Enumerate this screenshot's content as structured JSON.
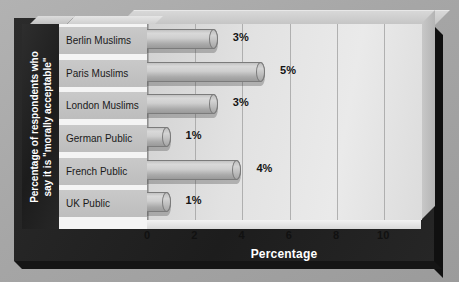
{
  "chart_data": {
    "type": "bar",
    "orientation": "horizontal",
    "title": "",
    "categories": [
      "Berlin Muslims",
      "Paris Muslims",
      "London Muslims",
      "German Public",
      "French Public",
      "UK Public"
    ],
    "values": [
      3,
      5,
      3,
      1,
      4,
      1
    ],
    "value_labels": [
      "3%",
      "5%",
      "3%",
      "1%",
      "4%",
      "1%"
    ],
    "xlabel": "Percentage",
    "ylabel": "Percentage of respondents who say it is \"morally acceptable\"",
    "ylabel_line1": "Percentage of respondents who",
    "ylabel_line2": "say it is \"morally acceptable\"",
    "xlim": [
      0,
      11.6
    ],
    "xticks": [
      0,
      2,
      4,
      6,
      8,
      10
    ],
    "xtick_labels": [
      "0",
      "2",
      "4",
      "6",
      "8",
      "10"
    ],
    "grid": "vertical",
    "legend": "none",
    "style": "3d-cylinder-bars"
  },
  "colors": {
    "board_background": "#232323",
    "plot_background": "#e2e2e2",
    "bar_fill": "#c4c4c4",
    "bar_outline": "#7b7b7b",
    "category_band": "#c4c4c4",
    "axis_text": "#111111",
    "title_text": "#ffffff",
    "page_background": "#a8a8a8"
  }
}
